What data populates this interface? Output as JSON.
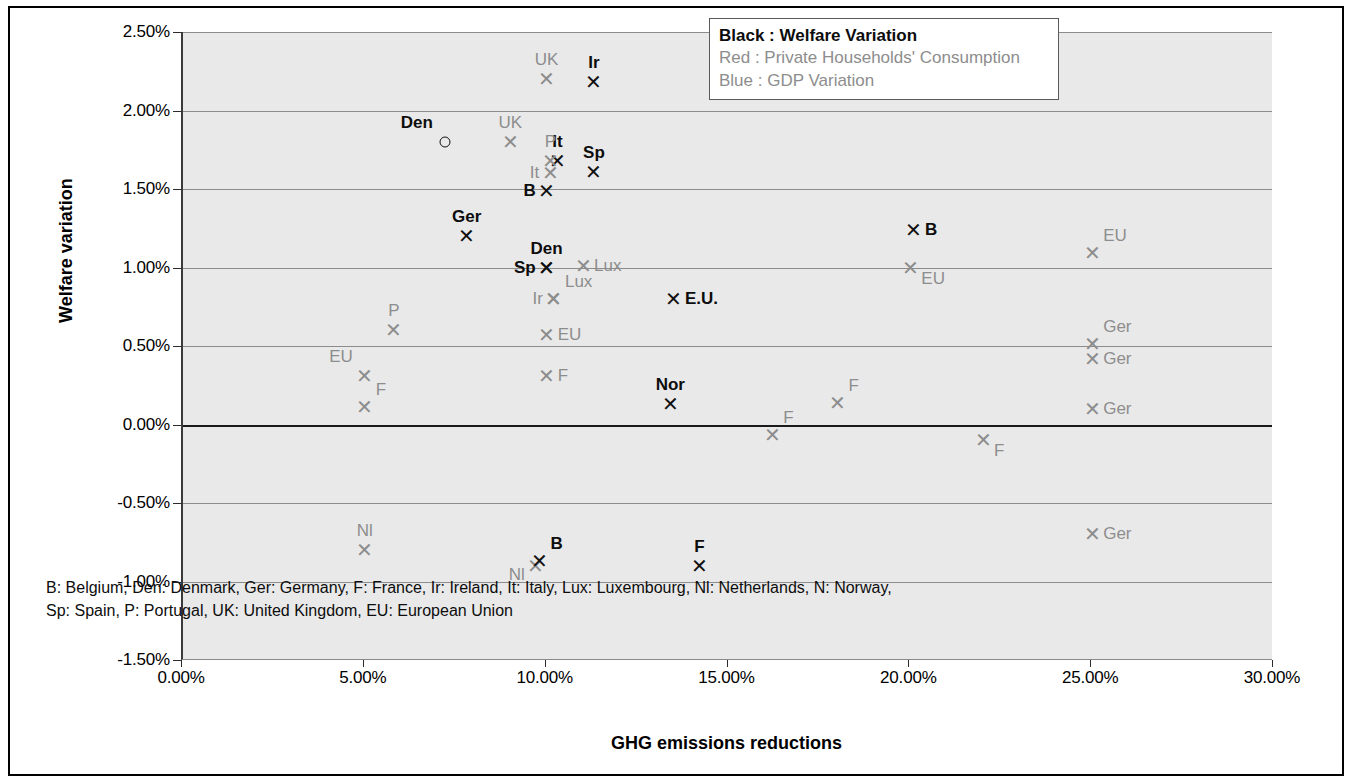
{
  "axes": {
    "xlabel": "GHG emissions reductions",
    "ylabel": "Welfare variation",
    "yticks": [
      "2.50%",
      "2.00%",
      "1.50%",
      "1.00%",
      "0.50%",
      "0.00%",
      "-0.50%",
      "-1.00%",
      "-1.50%"
    ],
    "xticks": [
      "0.00%",
      "5.00%",
      "10.00%",
      "15.00%",
      "20.00%",
      "25.00%",
      "30.00%"
    ]
  },
  "legend": {
    "items": [
      "Black : Welfare Variation",
      "Red : Private Households' Consumption",
      "Blue : GDP Variation"
    ]
  },
  "footnote": {
    "line1": "B: Belgium, Den: Denmark, Ger: Germany, F: France, Ir: Ireland, It: Italy, Lux: Luxembourg, Nl: Netherlands, N: Norway,",
    "line2": "Sp: Spain, P: Portugal, UK: United Kingdom, EU: European Union"
  },
  "chart_data": {
    "type": "scatter",
    "title": "",
    "xlabel": "GHG emissions reductions",
    "ylabel": "Welfare variation",
    "xlim": [
      0,
      30
    ],
    "ylim": [
      -1.5,
      2.5
    ],
    "xtick_values": [
      0,
      5,
      10,
      15,
      20,
      25,
      30
    ],
    "ytick_values": [
      2.5,
      2.0,
      1.5,
      1.0,
      0.5,
      0.0,
      -0.5,
      -1.0,
      -1.5
    ],
    "grid": "horizontal",
    "legend_position": "top-right",
    "units": "percent",
    "series": [
      {
        "name": "Welfare Variation",
        "color_name": "Black",
        "color": "#0d0d0d",
        "points": [
          {
            "label": "Ir",
            "x": 11.3,
            "y": 2.18,
            "marker": "x",
            "label_pos": "above"
          },
          {
            "label": "Sp",
            "x": 11.3,
            "y": 1.61,
            "marker": "x",
            "label_pos": "above"
          },
          {
            "label": "It",
            "x": 10.3,
            "y": 1.68,
            "marker": "x",
            "label_pos": "above"
          },
          {
            "label": "B",
            "x": 10.0,
            "y": 1.49,
            "marker": "x",
            "label_pos": "left"
          },
          {
            "label": "Den",
            "x": 7.2,
            "y": 1.8,
            "marker": "circle",
            "label_pos": "above-left"
          },
          {
            "label": "Ger",
            "x": 7.8,
            "y": 1.2,
            "marker": "x",
            "label_pos": "above"
          },
          {
            "label": "Den",
            "x": 10.0,
            "y": 1.0,
            "marker": "x",
            "label_pos": "above"
          },
          {
            "label": "Sp",
            "x": 10.0,
            "y": 1.0,
            "marker": "x",
            "label_pos": "left"
          },
          {
            "label": "B",
            "x": 20.1,
            "y": 1.24,
            "marker": "x",
            "label_pos": "right"
          },
          {
            "label": "E.U.",
            "x": 13.5,
            "y": 0.8,
            "marker": "x",
            "label_pos": "right"
          },
          {
            "label": "Nor",
            "x": 13.4,
            "y": 0.13,
            "marker": "x",
            "label_pos": "above"
          },
          {
            "label": "F",
            "x": 14.2,
            "y": -0.9,
            "marker": "x",
            "label_pos": "above"
          }
        ]
      },
      {
        "name": "Private Households' Consumption / GDP Variation",
        "color_name": "Grey",
        "color": "#8d8d8d",
        "points": [
          {
            "label": "UK",
            "x": 10.0,
            "y": 2.2,
            "marker": "x",
            "label_pos": "above"
          },
          {
            "label": "UK",
            "x": 9.0,
            "y": 1.8,
            "marker": "x",
            "label_pos": "above"
          },
          {
            "label": "P",
            "x": 10.1,
            "y": 1.68,
            "marker": "x",
            "label_pos": "above"
          },
          {
            "label": "It",
            "x": 10.1,
            "y": 1.6,
            "marker": "x",
            "label_pos": "left"
          },
          {
            "label": "Lux",
            "x": 11.0,
            "y": 1.01,
            "marker": "x",
            "label_pos": "right"
          },
          {
            "label": "Lux",
            "x": 10.2,
            "y": 0.8,
            "marker": "x",
            "label_pos": "above-right"
          },
          {
            "label": "Ir",
            "x": 10.2,
            "y": 0.8,
            "marker": "x",
            "label_pos": "left"
          },
          {
            "label": "EU",
            "x": 20.0,
            "y": 1.0,
            "marker": "x",
            "label_pos": "below-right"
          },
          {
            "label": "EU",
            "x": 25.0,
            "y": 1.09,
            "marker": "x",
            "label_pos": "above-right"
          },
          {
            "label": "EU",
            "x": 10.0,
            "y": 0.57,
            "marker": "x",
            "label_pos": "right"
          },
          {
            "label": "P",
            "x": 5.8,
            "y": 0.6,
            "marker": "x",
            "label_pos": "above"
          },
          {
            "label": "EU",
            "x": 5.0,
            "y": 0.31,
            "marker": "x",
            "label_pos": "above-left"
          },
          {
            "label": "F",
            "x": 5.0,
            "y": 0.11,
            "marker": "x",
            "label_pos": "above-right"
          },
          {
            "label": "F",
            "x": 10.0,
            "y": 0.31,
            "marker": "x",
            "label_pos": "right"
          },
          {
            "label": "F",
            "x": 18.0,
            "y": 0.14,
            "marker": "x",
            "label_pos": "above-right"
          },
          {
            "label": "F",
            "x": 16.2,
            "y": -0.07,
            "marker": "x",
            "label_pos": "above-right"
          },
          {
            "label": "F",
            "x": 22.0,
            "y": -0.1,
            "marker": "x",
            "label_pos": "below-right"
          },
          {
            "label": "Ger",
            "x": 25.0,
            "y": 0.51,
            "marker": "x",
            "label_pos": "above-right"
          },
          {
            "label": "Ger",
            "x": 25.0,
            "y": 0.42,
            "marker": "x",
            "label_pos": "right"
          },
          {
            "label": "Ger",
            "x": 25.0,
            "y": 0.1,
            "marker": "x",
            "label_pos": "right"
          },
          {
            "label": "Ger",
            "x": 25.0,
            "y": -0.7,
            "marker": "x",
            "label_pos": "right"
          },
          {
            "label": "Nl",
            "x": 5.0,
            "y": -0.8,
            "marker": "x",
            "label_pos": "above"
          },
          {
            "label": "Nl",
            "x": 9.7,
            "y": -0.9,
            "marker": "x",
            "label_pos": "below-left"
          },
          {
            "label": "B",
            "x": 9.8,
            "y": -0.87,
            "marker": "x",
            "label_pos": "above-right",
            "black": true
          }
        ]
      }
    ]
  }
}
